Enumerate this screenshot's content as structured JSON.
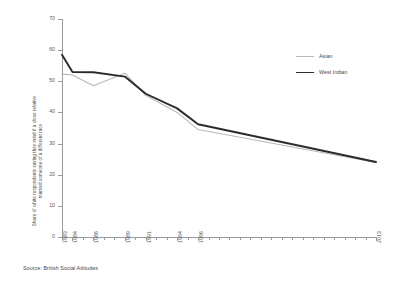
{
  "chart_data": {
    "type": "line",
    "title": "",
    "xlabel": "",
    "ylabel_line1": "Share of white respondents saying they mind if a close relative",
    "ylabel_line2": "married someone of a different race",
    "ylim": [
      0,
      70
    ],
    "xlim": [
      1983,
      2013
    ],
    "ytick_values": [
      0,
      10,
      20,
      30,
      40,
      50,
      60,
      70
    ],
    "ytick_labels": [
      "0",
      "10",
      "20",
      "30",
      "40",
      "50",
      "60",
      "70"
    ],
    "xtick_all": [
      1983,
      1984,
      1985,
      1986,
      1987,
      1988,
      1989,
      1990,
      1991,
      1992,
      1993,
      1994,
      1995,
      1996,
      1997,
      1998,
      1999,
      2000,
      2001,
      2002,
      2003,
      2004,
      2005,
      2006,
      2007,
      2008,
      2009,
      2010,
      2011,
      2012,
      2013
    ],
    "xtick_labeled": [
      "1983",
      "1984",
      "1986",
      "1989",
      "1991",
      "1994",
      "1996",
      "2013"
    ],
    "xtick_labeled_values": [
      1983,
      1984,
      1986,
      1989,
      1991,
      1994,
      1996,
      2013
    ],
    "grid": false,
    "legend_position": "right",
    "series": [
      {
        "name": "Asian",
        "color": "#b9b9b9",
        "width": 1.1,
        "x": [
          1983,
          1984,
          1986,
          1989,
          1991,
          1994,
          1996,
          2013
        ],
        "values": [
          52.3,
          52.0,
          48.6,
          52.6,
          45.5,
          40.0,
          34.5,
          23.9
        ]
      },
      {
        "name": "West Indian",
        "color": "#2b2b2b",
        "width": 1.9,
        "x": [
          1983,
          1984,
          1986,
          1989,
          1991,
          1994,
          1996,
          2013
        ],
        "values": [
          58.5,
          53.0,
          52.9,
          51.5,
          46.0,
          41.3,
          36.2,
          24.1
        ]
      }
    ]
  },
  "legend": {
    "items": [
      {
        "label": "Asian"
      },
      {
        "label": "West Indian"
      }
    ]
  },
  "source": {
    "text": "Source: British Social Attitudes"
  }
}
